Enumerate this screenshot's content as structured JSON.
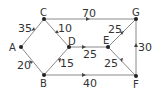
{
  "diagram": {
    "type": "directed-weighted-graph",
    "nodes": [
      {
        "id": "A",
        "x": 21,
        "y": 47
      },
      {
        "id": "B",
        "x": 44,
        "y": 75
      },
      {
        "id": "C",
        "x": 44,
        "y": 19
      },
      {
        "id": "D",
        "x": 69,
        "y": 47
      },
      {
        "id": "E",
        "x": 108,
        "y": 47
      },
      {
        "id": "F",
        "x": 136,
        "y": 76
      },
      {
        "id": "G",
        "x": 136,
        "y": 19
      }
    ],
    "edges": [
      {
        "from": "A",
        "to": "C",
        "weight": "35"
      },
      {
        "from": "A",
        "to": "B",
        "weight": "20"
      },
      {
        "from": "C",
        "to": "D",
        "weight": "10"
      },
      {
        "from": "B",
        "to": "D",
        "weight": "15"
      },
      {
        "from": "C",
        "to": "G",
        "weight": "70"
      },
      {
        "from": "D",
        "to": "E",
        "weight": "25"
      },
      {
        "from": "B",
        "to": "F",
        "weight": "40"
      },
      {
        "from": "E",
        "to": "G",
        "weight": "25"
      },
      {
        "from": "F",
        "to": "E",
        "weight": "25"
      },
      {
        "from": "F",
        "to": "G",
        "weight": "30"
      }
    ]
  }
}
